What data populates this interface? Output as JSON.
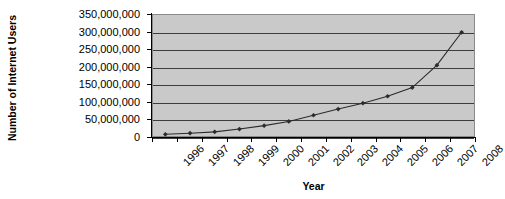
{
  "chart_data": {
    "type": "line",
    "title": "",
    "xlabel": "Year",
    "ylabel": "Number of Internet Users",
    "categories": [
      "1996",
      "1997",
      "1998",
      "1999",
      "2000",
      "2001",
      "2002",
      "2003",
      "2004",
      "2005",
      "2006",
      "2007",
      "2008"
    ],
    "values": [
      5000000,
      8000000,
      12000000,
      20000000,
      30000000,
      42000000,
      60000000,
      78000000,
      95000000,
      115000000,
      140000000,
      205000000,
      300000000
    ],
    "ylim": [
      0,
      350000000
    ],
    "ytick_values": [
      0,
      50000000,
      100000000,
      150000000,
      200000000,
      250000000,
      300000000,
      350000000
    ],
    "ytick_labels": [
      "0",
      "50,000,000",
      "100,000,000",
      "150,000,000",
      "200,000,000",
      "250,000,000",
      "300,000,000",
      "350,000,000"
    ],
    "gridlines_at": [
      0,
      50000000,
      100000000,
      150000000,
      200000000,
      250000000,
      300000000
    ],
    "grid": true,
    "legend": "none",
    "marker": "diamond",
    "series_color": "#2b2b2b",
    "plot_background": "#c9c9c9",
    "grid_color": "#3d3d3d",
    "axis_color": "#000000",
    "figure_background": "#ffffff"
  },
  "axes": {
    "y_title": "Number of Internet Users",
    "x_title": "Year"
  }
}
